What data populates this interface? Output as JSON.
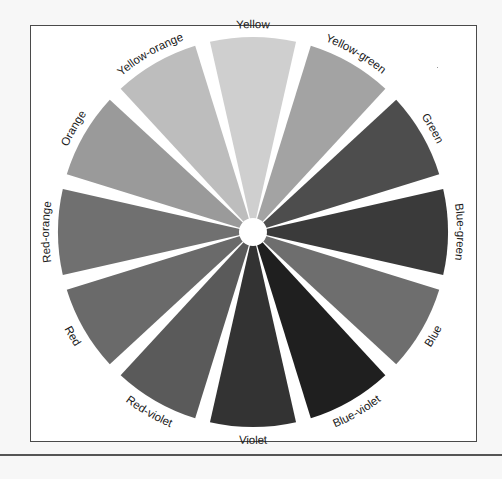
{
  "diagram": {
    "center": [
      253,
      232
    ],
    "outer_radius": 195,
    "gap_degrees": 4.5,
    "segments": [
      {
        "label": "Yellow",
        "angle": 0,
        "fill": "#cfcfcf"
      },
      {
        "label": "Yellow-green",
        "angle": 30,
        "fill": "#a3a3a3"
      },
      {
        "label": "Green",
        "angle": 60,
        "fill": "#4d4d4d"
      },
      {
        "label": "Blue-green",
        "angle": 90,
        "fill": "#3a3a3a"
      },
      {
        "label": "Blue",
        "angle": 120,
        "fill": "#6e6e6e"
      },
      {
        "label": "Blue-violet",
        "angle": 150,
        "fill": "#1f1f1f"
      },
      {
        "label": "Violet",
        "angle": 180,
        "fill": "#333333"
      },
      {
        "label": "Red-violet",
        "angle": 210,
        "fill": "#5a5a5a"
      },
      {
        "label": "Red",
        "angle": 240,
        "fill": "#6a6a6a"
      },
      {
        "label": "Red-orange",
        "angle": 270,
        "fill": "#707070"
      },
      {
        "label": "Orange",
        "angle": 300,
        "fill": "#9a9a9a"
      },
      {
        "label": "Yellow-orange",
        "angle": 330,
        "fill": "#bdbdbd"
      }
    ]
  }
}
